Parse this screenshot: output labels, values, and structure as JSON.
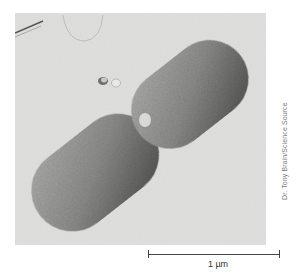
{
  "image": {
    "subject": "scanning electron micrograph of a dividing rod-shaped bacterium",
    "background_color": "#d9d9d7",
    "cell_color": "#8f8f8c"
  },
  "credit": "Dr. Tony Brain/Science Source",
  "scale_bar": {
    "label": "1 µm"
  }
}
